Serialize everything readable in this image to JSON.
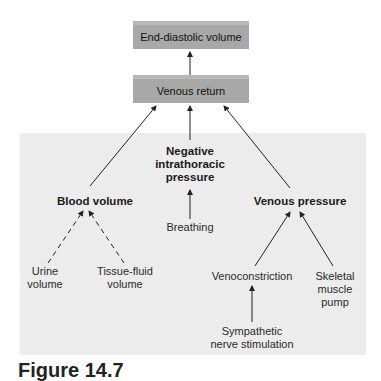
{
  "diagram": {
    "boxes": {
      "end_diastolic_volume": "End-diastolic volume",
      "venous_return": "Venous return"
    },
    "factors": {
      "blood_volume": "Blood volume",
      "negative_intrathoracic_pressure": [
        "Negative",
        "intrathoracic",
        "pressure"
      ],
      "venous_pressure": "Venous pressure"
    },
    "sub_factors": {
      "urine_volume": [
        "Urine",
        "volume"
      ],
      "tissue_fluid_volume": [
        "Tissue-fluid",
        "volume"
      ],
      "breathing": "Breathing",
      "venoconstriction": "Venoconstriction",
      "skeletal_muscle_pump": [
        "Skeletal",
        "muscle",
        "pump"
      ],
      "sympathetic_nerve_stimulation": [
        "Sympathetic",
        "nerve stimulation"
      ]
    },
    "caption": "Figure 14.7",
    "colors": {
      "box_fill": "#a8a8a8",
      "panel_fill": "#ececec",
      "arrow": "#222222"
    }
  }
}
